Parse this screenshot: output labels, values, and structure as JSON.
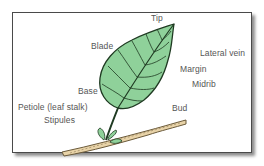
{
  "diagram": {
    "type": "labeled-illustration",
    "labels": {
      "tip": "Tip",
      "blade": "Blade",
      "lateral_vein": "Lateral vein",
      "margin": "Margin",
      "midrib": "Midrib",
      "base": "Base",
      "petiole": "Petiole (leaf stalk)",
      "stipules": "Stipules",
      "bud": "Bud"
    },
    "colors": {
      "leaf_fill": "#8fd19a",
      "leaf_outline": "#1f3a22",
      "twig_fill": "#e8d3a8",
      "twig_outline": "#6b5a3a",
      "frame_border": "#4a4a4a",
      "label_text": "#555555"
    }
  }
}
